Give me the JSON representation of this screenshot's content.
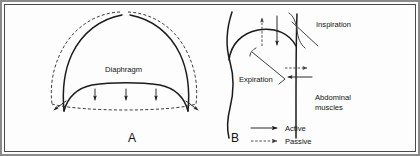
{
  "figure": {
    "panels": [
      {
        "id": "A",
        "letter": "A",
        "labels": [
          {
            "name": "diaphragm",
            "text": "Diaphragm"
          }
        ]
      },
      {
        "id": "B",
        "letter": "B",
        "labels": [
          {
            "name": "inspiration",
            "text": "Inspiration"
          },
          {
            "name": "expiration",
            "text": "Expiration"
          },
          {
            "name": "abdominal-muscles-line1",
            "text": "Abdominal"
          },
          {
            "name": "abdominal-muscles-line2",
            "text": "muscles"
          }
        ]
      }
    ],
    "legend": {
      "items": [
        {
          "name": "active",
          "label": "Active",
          "style": "solid-arrow"
        },
        {
          "name": "passive",
          "label": "Passive",
          "style": "dashed-arrow"
        }
      ]
    },
    "colors": {
      "ink": "#1b1b1b",
      "dashed_ink": "#3a3a3a",
      "outer_border": "#8b8b8b",
      "inner_border": "#4a4a4a",
      "background": "#fdfdfd"
    }
  }
}
